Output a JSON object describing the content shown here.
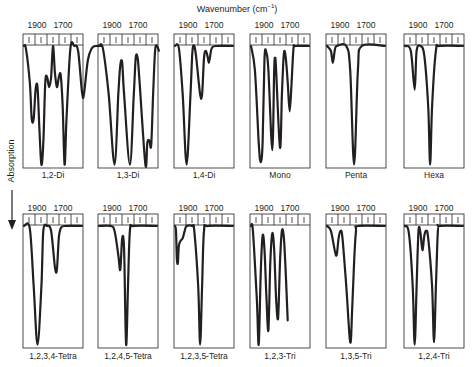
{
  "header": {
    "title": "Wavenumber (cm",
    "title_sup": "−1",
    "title_end": ")"
  },
  "yaxis": {
    "label": "Absorption",
    "arrow": "down-arrow"
  },
  "chart_data": {
    "type": "line",
    "title": "Wavenumber (cm−1)",
    "xlabel": "Wavenumber (cm−1)",
    "ylabel": "Absorption",
    "x_tick_labels": [
      "1900",
      "1700"
    ],
    "layout": "2 rows × 6 small-multiple panels; absorption increases downward",
    "panels": [
      {
        "label": "1,2-Di",
        "row": 0,
        "col": 0,
        "curve": [
          [
            0,
            0
          ],
          [
            1,
            0.02
          ],
          [
            3,
            0.3
          ],
          [
            4,
            0.6
          ],
          [
            5,
            0.6
          ],
          [
            6,
            0.36
          ],
          [
            7,
            0.34
          ],
          [
            8,
            0.7
          ],
          [
            9,
            0.98
          ],
          [
            10,
            0.8
          ],
          [
            11,
            0.3
          ],
          [
            12,
            0.26
          ],
          [
            13,
            0.34
          ],
          [
            14,
            0.26
          ],
          [
            15,
            0.0
          ],
          [
            16,
            0.22
          ],
          [
            17,
            0.34
          ],
          [
            18,
            0.26
          ],
          [
            19,
            0.24
          ],
          [
            20,
            0.5
          ],
          [
            21,
            0.98
          ],
          [
            22,
            0.6
          ],
          [
            24,
            0.02
          ],
          [
            26,
            0
          ],
          [
            28,
            0.04
          ],
          [
            30,
            0.38
          ],
          [
            31,
            0.4
          ],
          [
            33,
            0.12
          ],
          [
            35,
            0.02
          ],
          [
            37,
            0
          ],
          [
            40,
            0
          ]
        ]
      },
      {
        "label": "1,3-Di",
        "row": 0,
        "col": 1,
        "curve": [
          [
            0,
            0
          ],
          [
            2,
            0.02
          ],
          [
            5,
            0.4
          ],
          [
            8,
            0.98
          ],
          [
            10,
            0.4
          ],
          [
            11,
            0.16
          ],
          [
            12,
            0.14
          ],
          [
            13,
            0.4
          ],
          [
            16,
            0.98
          ],
          [
            18,
            0.4
          ],
          [
            19,
            0.1
          ],
          [
            20,
            0.1
          ],
          [
            21,
            0.3
          ],
          [
            24,
            0.98
          ],
          [
            25,
            0.8
          ],
          [
            26,
            0.78
          ],
          [
            27,
            0.82
          ],
          [
            28,
            0.4
          ],
          [
            29,
            0.04
          ],
          [
            30,
            0.0
          ],
          [
            31,
            0.04
          ]
        ]
      },
      {
        "label": "1,4-Di",
        "row": 0,
        "col": 2,
        "curve": [
          [
            0,
            0
          ],
          [
            2,
            0.02
          ],
          [
            4,
            0.4
          ],
          [
            6,
            0.98
          ],
          [
            8,
            0.4
          ],
          [
            9,
            0.05
          ],
          [
            10,
            0.0
          ],
          [
            11,
            0.1
          ],
          [
            13,
            0.4
          ],
          [
            14,
            0.4
          ],
          [
            15,
            0.1
          ],
          [
            16,
            0.04
          ],
          [
            17,
            0.1
          ],
          [
            17.5,
            0.14
          ],
          [
            18,
            0.1
          ],
          [
            19,
            0.02
          ],
          [
            21,
            0
          ],
          [
            30,
            0
          ]
        ]
      },
      {
        "label": "Mono",
        "row": 0,
        "col": 3,
        "curve": [
          [
            0,
            0
          ],
          [
            2,
            0.2
          ],
          [
            4,
            0.8
          ],
          [
            5,
            0.96
          ],
          [
            6,
            0.8
          ],
          [
            7,
            0.1
          ],
          [
            8,
            0.06
          ],
          [
            9,
            0.2
          ],
          [
            11,
            0.86
          ],
          [
            12,
            0.2
          ],
          [
            12.5,
            0.1
          ],
          [
            13,
            0.2
          ],
          [
            15,
            0.84
          ],
          [
            16,
            0.4
          ],
          [
            17,
            0.06
          ],
          [
            18,
            0.1
          ],
          [
            19,
            0.3
          ],
          [
            20,
            0.54
          ],
          [
            21,
            0.3
          ],
          [
            22,
            0.02
          ],
          [
            23,
            0
          ],
          [
            30,
            0
          ]
        ]
      },
      {
        "label": "Penta",
        "row": 0,
        "col": 4,
        "curve": [
          [
            0,
            0
          ],
          [
            2,
            0.04
          ],
          [
            3,
            0.14
          ],
          [
            4,
            0.04
          ],
          [
            5,
            0
          ],
          [
            10,
            0
          ],
          [
            12,
            0.2
          ],
          [
            14,
            0.98
          ],
          [
            16,
            0.2
          ],
          [
            18,
            0
          ],
          [
            30,
            0
          ]
        ]
      },
      {
        "label": "Hexa",
        "row": 0,
        "col": 5,
        "curve": [
          [
            0,
            0
          ],
          [
            3,
            0.04
          ],
          [
            5,
            0.36
          ],
          [
            6,
            0.04
          ],
          [
            8,
            0
          ],
          [
            10,
            0.08
          ],
          [
            12,
            0.5
          ],
          [
            13,
            0.98
          ],
          [
            14,
            0.5
          ],
          [
            16,
            0.04
          ],
          [
            18,
            0
          ],
          [
            30,
            0
          ]
        ]
      },
      {
        "label": "1,2,3,4-Tetra",
        "row": 1,
        "col": 0,
        "curve": [
          [
            0,
            0
          ],
          [
            3,
            0.02
          ],
          [
            5,
            0.5
          ],
          [
            7,
            0.98
          ],
          [
            9,
            0.5
          ],
          [
            10,
            0.04
          ],
          [
            12,
            0
          ],
          [
            14,
            0.04
          ],
          [
            16,
            0.34
          ],
          [
            17,
            0.36
          ],
          [
            18,
            0.1
          ],
          [
            19,
            0.02
          ],
          [
            21,
            0
          ],
          [
            30,
            0
          ]
        ]
      },
      {
        "label": "1,2,4,5-Tetra",
        "row": 1,
        "col": 1,
        "curve": [
          [
            0,
            0
          ],
          [
            6,
            0
          ],
          [
            8,
            0.04
          ],
          [
            10,
            0.24
          ],
          [
            11,
            0.36
          ],
          [
            12,
            0.1
          ],
          [
            13,
            0.2
          ],
          [
            14,
            0.98
          ],
          [
            15,
            0.5
          ],
          [
            16,
            0.04
          ],
          [
            18,
            0
          ],
          [
            30,
            0
          ]
        ]
      },
      {
        "label": "1,2,3,5-Tetra",
        "row": 1,
        "col": 2,
        "curve": [
          [
            0,
            0
          ],
          [
            0.5,
            0.04
          ],
          [
            1,
            0.28
          ],
          [
            1.5,
            0.3
          ],
          [
            2,
            0.16
          ],
          [
            3,
            0.12
          ],
          [
            4,
            0.1
          ],
          [
            5,
            0.04
          ],
          [
            6,
            0
          ],
          [
            9,
            0
          ],
          [
            10,
            0.04
          ],
          [
            12,
            0.5
          ],
          [
            13,
            0.98
          ],
          [
            14,
            0.5
          ],
          [
            15,
            0.04
          ],
          [
            17,
            0
          ],
          [
            30,
            0
          ]
        ]
      },
      {
        "label": "1,2,3-Tri",
        "row": 1,
        "col": 3,
        "curve": [
          [
            0,
            0
          ],
          [
            1,
            0.04
          ],
          [
            3,
            0.6
          ],
          [
            4,
            0.98
          ],
          [
            5,
            0.4
          ],
          [
            6,
            0.08
          ],
          [
            7,
            0.2
          ],
          [
            8,
            0.6
          ],
          [
            9,
            0.86
          ],
          [
            10,
            0.3
          ],
          [
            11,
            0.06
          ],
          [
            12,
            0.2
          ],
          [
            13,
            0.6
          ],
          [
            14,
            0.76
          ],
          [
            15,
            0.3
          ],
          [
            16,
            0.04
          ],
          [
            17,
            0.1
          ],
          [
            18,
            0.4
          ],
          [
            19,
            0.78
          ]
        ]
      },
      {
        "label": "1,3,5-Tri",
        "row": 1,
        "col": 4,
        "curve": [
          [
            0,
            0
          ],
          [
            2,
            0.04
          ],
          [
            4,
            0.2
          ],
          [
            5,
            0.24
          ],
          [
            6,
            0.1
          ],
          [
            7,
            0.04
          ],
          [
            8,
            0.1
          ],
          [
            10,
            0.5
          ],
          [
            12,
            0.96
          ],
          [
            13,
            0.7
          ],
          [
            14,
            0.3
          ],
          [
            15,
            0.04
          ],
          [
            16,
            0
          ],
          [
            30,
            0
          ]
        ]
      },
      {
        "label": "1,2,4-Tri",
        "row": 1,
        "col": 5,
        "curve": [
          [
            0,
            0
          ],
          [
            2,
            0.06
          ],
          [
            4,
            0.5
          ],
          [
            5,
            0.98
          ],
          [
            6,
            0.5
          ],
          [
            7,
            0.04
          ],
          [
            8,
            0.06
          ],
          [
            9,
            0.2
          ],
          [
            10,
            0.08
          ],
          [
            11,
            0.04
          ],
          [
            12,
            0.1
          ],
          [
            14,
            0.5
          ],
          [
            15,
            0.96
          ],
          [
            16,
            0.5
          ],
          [
            17,
            0.04
          ],
          [
            18,
            0
          ],
          [
            30,
            0
          ]
        ]
      }
    ]
  }
}
